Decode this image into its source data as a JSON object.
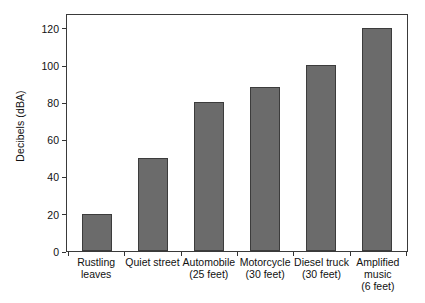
{
  "chart_data": {
    "type": "bar",
    "title": "",
    "subtitle": "",
    "xlabel": "",
    "ylabel": "Decibels (dBA)",
    "categories": [
      "Rustling leaves",
      "Quiet street",
      "Automobile (25 feet)",
      "Motorcycle (30 feet)",
      "Diesel truck (30 feet)",
      "Amplified music (6 feet)"
    ],
    "category_lines": [
      [
        "Rustling",
        "leaves"
      ],
      [
        "Quiet street"
      ],
      [
        "Automobile",
        "(25 feet)"
      ],
      [
        "Motorcycle",
        "(30 feet)"
      ],
      [
        "Diesel truck",
        "(30 feet)"
      ],
      [
        "Amplified",
        "music",
        "(6 feet)"
      ]
    ],
    "values": [
      20,
      50,
      80,
      88,
      100,
      120
    ],
    "ylim": [
      0,
      128
    ],
    "yticks": [
      0,
      20,
      40,
      60,
      80,
      100,
      120
    ],
    "ytick_labels": [
      "0",
      "20",
      "40",
      "60",
      "80",
      "100",
      "120"
    ],
    "grid": false,
    "legend": false,
    "legend_position": "none",
    "bar_color": "#6b6b6b",
    "bar_border_color": "#3c3c3c",
    "frame_color": "#3a3a3a",
    "background_color": "#ffffff"
  }
}
